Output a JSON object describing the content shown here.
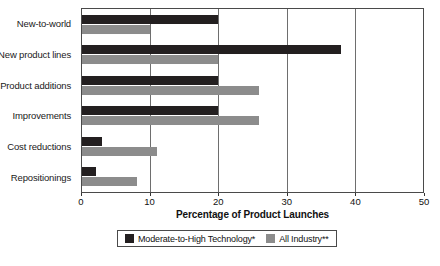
{
  "chart_data": {
    "type": "bar",
    "orientation": "horizontal",
    "title": "",
    "xlabel": "Percentage of Product Launches",
    "ylabel": "",
    "xlim": [
      0,
      50
    ],
    "xticks": [
      0,
      10,
      20,
      30,
      40,
      50
    ],
    "xtick_labels": [
      "0",
      "10",
      "20",
      "30",
      "40",
      "50"
    ],
    "grid": true,
    "grid_axis": "x",
    "legend_position": "bottom-center",
    "categories": [
      "New-to-world",
      "New product lines",
      "Product additions",
      "Improvements",
      "Cost reductions",
      "Repositionings"
    ],
    "series": [
      {
        "name": "Moderate-to-High Technology*",
        "color": "#231f20",
        "values": [
          20,
          38,
          20,
          20,
          3,
          2
        ]
      },
      {
        "name": "All Industry**",
        "color": "#8c8c8c",
        "values": [
          10,
          20,
          26,
          26,
          11,
          8
        ]
      }
    ]
  }
}
